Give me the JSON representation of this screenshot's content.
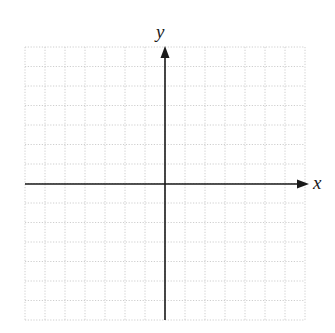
{
  "diagram": {
    "type": "coordinate-plane",
    "axes": {
      "x_label": "x",
      "y_label": "y"
    },
    "grid": {
      "columns": 14,
      "rows": 14,
      "columns_left_of_y_axis": 7,
      "columns_right_of_y_axis": 7,
      "rows_above_x_axis": 7,
      "rows_below_x_axis": 7,
      "line_style": "dotted"
    },
    "colors": {
      "axis": "#1a1a1a",
      "grid": "#c8c8c8",
      "background": "#ffffff"
    }
  }
}
